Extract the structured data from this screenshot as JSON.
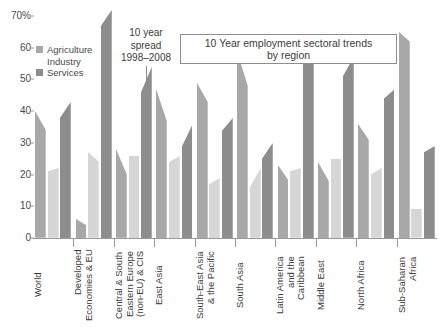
{
  "chart": {
    "title_line1": "10 Year employment sectoral trends",
    "title_line2": "by region",
    "annotation_line1": "10 year",
    "annotation_line2": "spread",
    "annotation_line3": "1998–2008"
  },
  "legend": {
    "items": [
      {
        "label": "Agriculture",
        "color": "#a8a8a8"
      },
      {
        "label": "Industry",
        "color": "#d6d6d6"
      },
      {
        "label": "Services",
        "color": "#8d8d8d"
      }
    ]
  },
  "chart_data": {
    "type": "area",
    "title": "10 Year employment sectoral trends by region",
    "subtitle": "10 year spread 1998–2008",
    "xlabel": "",
    "ylabel": "",
    "ylim": [
      0,
      70
    ],
    "ytick_labels": [
      "0",
      "10",
      "20",
      "30",
      "40",
      "50",
      "60",
      "70%"
    ],
    "ytick_values": [
      0,
      10,
      20,
      30,
      40,
      50,
      60,
      70
    ],
    "grid": false,
    "legend_position": "top-left",
    "series_names": [
      "Agriculture",
      "Industry",
      "Services"
    ],
    "series_colors": [
      "#a8a8a8",
      "#d6d6d6",
      "#8d8d8d"
    ],
    "note": "Each region shows three vertical bands; each band is a 10-year spread (1998 at left edge, 2008 at right edge) so the band top slopes from the 1998 value to the 2008 value.",
    "categories": [
      "World",
      "Developed Economies & EU",
      "Central & South Eastern Europe (non-EU) & CIS",
      "East Asia",
      "South-East Asia & the Pacific",
      "South Asia",
      "Latin America and the Caribbean",
      "Middle East",
      "North Africa",
      "Sub-Saharan Africa"
    ],
    "category_labels": [
      "World",
      "Developed\nEconomies & EU",
      "Central & South\nEastern Europe\n(non-EU) & CIS",
      "East Asia",
      "South-East Asia\n& the Pacific",
      "South Asia",
      "Latin America\nand the\nCaribbean",
      "Middle East",
      "North Africa",
      "Sub-Saharan\nAfrica"
    ],
    "data": [
      {
        "region": "World",
        "Agriculture": {
          "start": 40,
          "end": 34
        },
        "Industry": {
          "start": 21,
          "end": 22
        },
        "Services": {
          "start": 38,
          "end": 43
        }
      },
      {
        "region": "Developed Economies & EU",
        "Agriculture": {
          "start": 6,
          "end": 4
        },
        "Industry": {
          "start": 27,
          "end": 24
        },
        "Services": {
          "start": 67,
          "end": 72
        }
      },
      {
        "region": "Central & South Eastern Europe (non-EU) & CIS",
        "Agriculture": {
          "start": 28,
          "end": 20
        },
        "Industry": {
          "start": 26,
          "end": 26
        },
        "Services": {
          "start": 46,
          "end": 54
        }
      },
      {
        "region": "East Asia",
        "Agriculture": {
          "start": 47,
          "end": 37
        },
        "Industry": {
          "start": 24,
          "end": 26
        },
        "Services": {
          "start": 29,
          "end": 36
        }
      },
      {
        "region": "South-East Asia & the Pacific",
        "Agriculture": {
          "start": 49,
          "end": 43
        },
        "Industry": {
          "start": 17,
          "end": 19
        },
        "Services": {
          "start": 34,
          "end": 38
        }
      },
      {
        "region": "South Asia",
        "Agriculture": {
          "start": 59,
          "end": 48
        },
        "Industry": {
          "start": 16,
          "end": 22
        },
        "Services": {
          "start": 25,
          "end": 30
        }
      },
      {
        "region": "Latin America and the Caribbean",
        "Agriculture": {
          "start": 23,
          "end": 18
        },
        "Industry": {
          "start": 21,
          "end": 22
        },
        "Services": {
          "start": 56,
          "end": 60
        }
      },
      {
        "region": "Middle East",
        "Agriculture": {
          "start": 24,
          "end": 18
        },
        "Industry": {
          "start": 25,
          "end": 25
        },
        "Services": {
          "start": 51,
          "end": 57
        }
      },
      {
        "region": "North Africa",
        "Agriculture": {
          "start": 36,
          "end": 31
        },
        "Industry": {
          "start": 20,
          "end": 22
        },
        "Services": {
          "start": 44,
          "end": 47
        }
      },
      {
        "region": "Sub-Saharan Africa",
        "Agriculture": {
          "start": 65,
          "end": 62
        },
        "Industry": {
          "start": 9,
          "end": 9
        },
        "Services": {
          "start": 27,
          "end": 29
        }
      }
    ]
  }
}
